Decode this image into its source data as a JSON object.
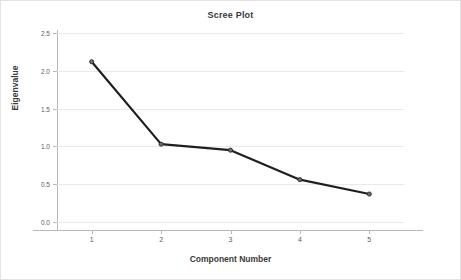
{
  "chart_data": {
    "type": "line",
    "title": "Scree Plot",
    "xlabel": "Component Number",
    "ylabel": "Eigenvalue",
    "categories": [
      "1",
      "2",
      "3",
      "4",
      "5"
    ],
    "x": [
      1,
      2,
      3,
      4,
      5
    ],
    "values": [
      2.12,
      1.03,
      0.95,
      0.56,
      0.37
    ],
    "series": [
      {
        "name": "Eigenvalue",
        "values": [
          2.12,
          1.03,
          0.95,
          0.56,
          0.37
        ]
      }
    ],
    "xlim": [
      0.5,
      5.5
    ],
    "ylim": [
      0.0,
      2.5
    ],
    "yticks": [
      "0.0",
      "0.5",
      "1.0",
      "1.5",
      "2.0",
      "2.5"
    ],
    "ytick_values": [
      0.0,
      0.5,
      1.0,
      1.5,
      2.0,
      2.5
    ],
    "xticks": [
      "1",
      "2",
      "3",
      "4",
      "5"
    ],
    "grid": "horizontal",
    "legend": "none",
    "marker": "circle",
    "line_color": "#1f1f1f",
    "marker_color": "#6b6b6b",
    "grid_color": "#e9e9ea",
    "axis_color": "#b9b9b9",
    "background_color": "#ffffff",
    "text_color": "#3a3a3a"
  }
}
